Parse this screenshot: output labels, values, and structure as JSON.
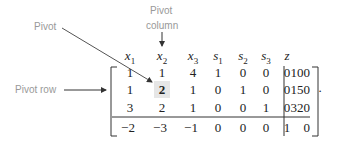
{
  "labels": {
    "pivot": "Pivot",
    "pivot_column_line1": "Pivot",
    "pivot_column_line2": "column",
    "pivot_row": "Pivot row"
  },
  "tableau": {
    "headers": [
      {
        "var": "x",
        "sub": "1"
      },
      {
        "var": "x",
        "sub": "2"
      },
      {
        "var": "x",
        "sub": "3"
      },
      {
        "var": "s",
        "sub": "1"
      },
      {
        "var": "s",
        "sub": "2"
      },
      {
        "var": "s",
        "sub": "3"
      },
      {
        "var": "z",
        "sub": ""
      }
    ],
    "rows": [
      {
        "coeffs": [
          "1",
          "1",
          "4",
          "1",
          "0",
          "0",
          "0"
        ],
        "rhs": "100"
      },
      {
        "coeffs": [
          "1",
          "2",
          "1",
          "0",
          "1",
          "0",
          "0"
        ],
        "rhs": "150"
      },
      {
        "coeffs": [
          "3",
          "2",
          "1",
          "0",
          "0",
          "1",
          "0"
        ],
        "rhs": "320"
      },
      {
        "coeffs": [
          "−2",
          "−3",
          "−1",
          "0",
          "0",
          "0",
          "1"
        ],
        "rhs": "0"
      }
    ],
    "pivot": {
      "row": 1,
      "col": 1
    },
    "trailing_punctuation": "."
  },
  "colors": {
    "label_text": "#999999",
    "arrow": "#444444",
    "pivot_highlight": "#e6e6e6"
  }
}
